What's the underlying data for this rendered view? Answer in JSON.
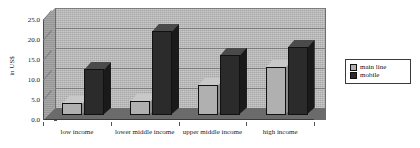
{
  "chart_data": {
    "type": "bar",
    "title": "",
    "subtitle": "",
    "xlabel": "",
    "ylabel": "in US$",
    "ylim": [
      0,
      25
    ],
    "ytick_labels": [
      "25.0",
      "20.0",
      "15.0",
      "10.0",
      "5.0",
      "0.0"
    ],
    "ytick_values": [
      25.0,
      20.0,
      15.0,
      10.0,
      5.0,
      0.0
    ],
    "grid": true,
    "legend_position": "right",
    "style": "3d-clustered-column",
    "categories": [
      "low income",
      "lower middle income",
      "upper middle income",
      "high income"
    ],
    "series": [
      {
        "name": "main line",
        "color": "#b0b0b0",
        "values": [
          3.0,
          3.5,
          7.5,
          12.0
        ]
      },
      {
        "name": "mobile",
        "color": "#2b2b2b",
        "values": [
          11.5,
          21.0,
          15.0,
          17.0
        ]
      }
    ]
  },
  "legend": {
    "items": [
      {
        "label": "main line",
        "swatch": "mainline"
      },
      {
        "label": "mobile",
        "swatch": "mobile"
      }
    ]
  },
  "colors": {
    "series_main_line": "#b0b0b0",
    "series_mobile": "#2b2b2b",
    "plot_back_wall": "#b9b9b9",
    "plot_floor": "#6b6b6b",
    "gridline": "#7d7d7d",
    "text": "#1a1a1a"
  }
}
